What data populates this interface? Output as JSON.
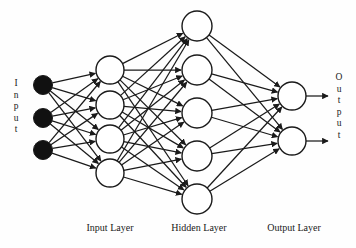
{
  "diagram": {
    "side_labels": {
      "input_word": "Input",
      "output_word": "Output"
    },
    "captions": {
      "input_layer": "Input Layer",
      "hidden_layer": "Hidden Layer",
      "output_layer": "Output Layer"
    },
    "colors": {
      "stroke": "#1a1a1a",
      "node_fill": "#ffffff",
      "input_node_fill": "#111111",
      "background": "#fefefe"
    },
    "layers": [
      {
        "name": "input-source",
        "caption": "",
        "node_count": 3,
        "filled": true,
        "radius": 9.5,
        "x": 43,
        "ys": [
          85,
          118,
          150
        ]
      },
      {
        "name": "input-layer",
        "caption": "Input Layer",
        "node_count": 4,
        "filled": false,
        "radius": 14,
        "x": 110,
        "ys": [
          70,
          105,
          139,
          173
        ]
      },
      {
        "name": "hidden-layer",
        "caption": "Hidden Layer",
        "node_count": 5,
        "filled": false,
        "radius": 15,
        "x": 197,
        "ys": [
          26,
          70,
          113,
          156,
          199
        ]
      },
      {
        "name": "output-layer",
        "caption": "Output Layer",
        "node_count": 2,
        "filled": false,
        "radius": 14,
        "x": 292,
        "ys": [
          96,
          141
        ]
      }
    ],
    "connections": [
      {
        "from": "input-source",
        "to": "input-layer",
        "fully_connected": true,
        "arrowheads": true
      },
      {
        "from": "input-layer",
        "to": "hidden-layer",
        "fully_connected": true,
        "arrowheads": true
      },
      {
        "from": "hidden-layer",
        "to": "output-layer",
        "fully_connected": true,
        "arrowheads": true
      }
    ],
    "output_arrows": {
      "count": 2,
      "length": 22,
      "ys": [
        96,
        141
      ],
      "x_start": 306
    }
  }
}
